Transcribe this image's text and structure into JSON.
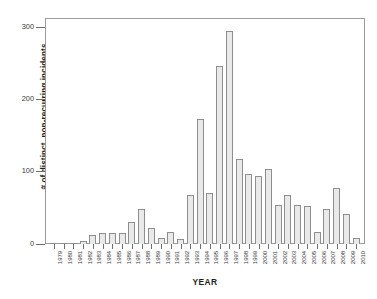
{
  "chart_data": {
    "type": "bar",
    "title": "",
    "xlabel": "YEAR",
    "ylabel": "# of distinct, non-recurring incidents",
    "ylim": [
      0,
      310
    ],
    "yticks": [
      0,
      100,
      200,
      300
    ],
    "grid": false,
    "legend": false,
    "bar_fill_color": "#e9e9e9",
    "bar_edge_color": "#8e8e8e",
    "axis_color": "#9b9b9b",
    "categories": [
      "1979",
      "1980",
      "1981",
      "1982",
      "1983",
      "1984",
      "1985",
      "1986",
      "1987",
      "1988",
      "1989",
      "1990",
      "1991",
      "1992",
      "1993",
      "1994",
      "1995",
      "1996",
      "1997",
      "1998",
      "1999",
      "2000",
      "2001",
      "2002",
      "2003",
      "2004",
      "2005",
      "2006",
      "2007",
      "2008",
      "2009",
      "2010"
    ],
    "values": [
      1,
      1,
      1,
      4,
      13,
      15,
      15,
      15,
      31,
      48,
      22,
      9,
      17,
      7,
      68,
      173,
      70,
      246,
      295,
      117,
      97,
      94,
      104,
      54,
      68,
      54,
      52,
      17,
      48,
      77,
      41,
      9
    ]
  }
}
